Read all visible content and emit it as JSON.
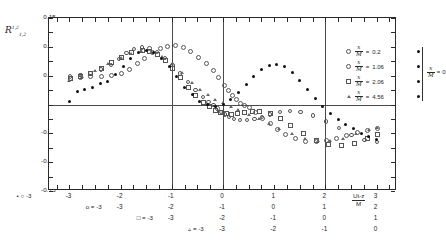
{
  "chart_data": {
    "type": "scatter",
    "title": "",
    "ylabel": "R_{1,2}^{1,2}",
    "xlabel": "Ut-z/M",
    "ylim": [
      -0.15,
      0.15
    ],
    "yticks": [
      0.15,
      0.1,
      0.05,
      0,
      -0.05,
      -0.1,
      -0.15
    ],
    "ytick_labels": [
      "0.15",
      "0.10",
      "0.05",
      "0",
      "-0.05",
      "-0.10",
      "-0.15"
    ],
    "xlim": [
      -3.4,
      3.4
    ],
    "xticks": [
      -3,
      -2,
      -1,
      0,
      1,
      2,
      3
    ],
    "grid": "major vertical rules at x = -1, 0, 2 and horizontal zero line",
    "legend_position": "upper-right inset",
    "series": [
      {
        "name": "x/M = 0.2",
        "marker": "open-circle",
        "xoffset": 0,
        "axis_row": 0,
        "x": [
          -3.0,
          -2.8,
          -2.6,
          -2.4,
          -2.2,
          -2.0,
          -1.85,
          -1.7,
          -1.55,
          -1.4,
          -1.25,
          -1.1,
          -0.95,
          -0.8,
          -0.65,
          -0.5,
          -0.35,
          -0.2,
          -0.1,
          0,
          0.08,
          0.16,
          0.24,
          0.32,
          0.4,
          0.5,
          0.62,
          0.75,
          0.9,
          1.05,
          1.2,
          1.4,
          1.6,
          1.8,
          2.0,
          2.2,
          2.4,
          2.6,
          2.8,
          3.0
        ],
        "y": [
          0.047,
          0.048,
          0.05,
          0.05,
          0.052,
          0.055,
          0.063,
          0.072,
          0.082,
          0.092,
          0.099,
          0.103,
          0.104,
          0.1,
          0.093,
          0.084,
          0.073,
          0.06,
          0.048,
          0.035,
          0.026,
          0.018,
          0.01,
          0.004,
          0.0,
          -0.004,
          -0.012,
          -0.022,
          -0.032,
          -0.042,
          -0.05,
          -0.058,
          -0.062,
          -0.063,
          -0.061,
          -0.057,
          -0.052,
          -0.047,
          -0.043,
          -0.04
        ]
      },
      {
        "name": "x/M = 1.06",
        "marker": "open-circle-small",
        "xoffset": 1,
        "axis_row": 1,
        "x": [
          -3.0,
          -2.8,
          -2.6,
          -2.4,
          -2.2,
          -2.05,
          -1.9,
          -1.75,
          -1.6,
          -1.45,
          -1.3,
          -1.15,
          -1.0,
          -0.85,
          -0.7,
          -0.55,
          -0.4,
          -0.3,
          -0.2,
          -0.12,
          -0.05,
          0.02,
          0.1,
          0.2,
          0.32,
          0.45,
          0.6,
          0.75,
          0.9,
          1.1,
          1.3,
          1.5,
          1.75,
          2.0,
          2.25,
          2.5,
          2.75,
          3.0
        ],
        "y": [
          0.05,
          0.052,
          0.056,
          0.062,
          0.07,
          0.08,
          0.09,
          0.097,
          0.1,
          0.098,
          0.092,
          0.082,
          0.07,
          0.055,
          0.04,
          0.026,
          0.014,
          0.006,
          0.0,
          -0.006,
          -0.012,
          -0.016,
          -0.02,
          -0.024,
          -0.026,
          -0.026,
          -0.024,
          -0.02,
          -0.016,
          -0.012,
          -0.01,
          -0.012,
          -0.018,
          -0.028,
          -0.04,
          -0.052,
          -0.06,
          -0.064
        ]
      },
      {
        "name": "x/M = 2.06",
        "marker": "open-square",
        "xoffset": 2,
        "axis_row": 2,
        "x": [
          -3.0,
          -2.8,
          -2.6,
          -2.4,
          -2.2,
          -2.0,
          -1.8,
          -1.6,
          -1.45,
          -1.3,
          -1.15,
          -1.0,
          -0.85,
          -0.7,
          -0.55,
          -0.4,
          -0.28,
          -0.16,
          -0.06,
          0.04,
          0.14,
          0.26,
          0.4,
          0.55,
          0.7,
          0.9,
          1.1,
          1.3,
          1.55,
          1.8,
          2.05,
          2.3,
          2.55,
          2.8,
          3.0
        ],
        "y": [
          0.046,
          0.05,
          0.056,
          0.064,
          0.074,
          0.084,
          0.092,
          0.096,
          0.094,
          0.088,
          0.078,
          0.064,
          0.048,
          0.032,
          0.018,
          0.006,
          -0.002,
          -0.008,
          -0.012,
          -0.014,
          -0.015,
          -0.014,
          -0.012,
          -0.01,
          -0.01,
          -0.014,
          -0.022,
          -0.034,
          -0.048,
          -0.06,
          -0.068,
          -0.07,
          -0.066,
          -0.058,
          -0.05
        ]
      },
      {
        "name": "x/M = 4.56",
        "marker": "triangle",
        "xoffset": 3,
        "axis_row": 3,
        "x": [
          -3.0,
          -2.75,
          -2.5,
          -2.25,
          -2.0,
          -1.8,
          -1.6,
          -1.4,
          -1.2,
          -1.0,
          -0.8,
          -0.6,
          -0.45,
          -0.3,
          -0.15,
          0,
          0.15,
          0.3,
          0.5,
          0.7,
          0.9,
          1.1,
          1.35,
          1.6,
          1.85,
          2.1,
          2.35,
          2.6,
          2.85,
          3.0
        ],
        "y": [
          0.04,
          0.048,
          0.058,
          0.07,
          0.08,
          0.088,
          0.092,
          0.09,
          0.082,
          0.07,
          0.054,
          0.038,
          0.026,
          0.016,
          0.008,
          0.002,
          -0.004,
          -0.01,
          -0.018,
          -0.026,
          -0.034,
          -0.042,
          -0.052,
          -0.06,
          -0.064,
          -0.064,
          -0.06,
          -0.052,
          -0.044,
          -0.04
        ]
      },
      {
        "name": "x/M = 0",
        "marker": "filled-circle",
        "xoffset": 0,
        "axis_row": "all",
        "x": [
          -3.0,
          -2.85,
          -2.7,
          -2.55,
          -2.4,
          -2.25,
          -2.1,
          -1.95,
          -1.8,
          -1.65,
          -1.5,
          -1.35,
          -1.2,
          -1.05,
          -0.9,
          -0.75,
          -0.6,
          -0.45,
          -0.3,
          -0.15,
          0,
          0.15,
          0.3,
          0.45,
          0.6,
          0.75,
          0.9,
          1.05,
          1.2,
          1.35,
          1.5,
          1.65,
          1.8,
          1.95,
          2.1,
          2.25,
          2.4,
          2.55,
          2.7,
          2.85,
          3.0
        ],
        "y": [
          0.006,
          0.022,
          0.026,
          0.03,
          0.036,
          0.04,
          0.052,
          0.066,
          0.08,
          0.09,
          0.094,
          0.09,
          0.08,
          0.066,
          0.048,
          0.03,
          0.018,
          0.006,
          0.0,
          -0.004,
          0.0,
          0.008,
          0.02,
          0.034,
          0.048,
          0.06,
          0.068,
          0.07,
          0.066,
          0.056,
          0.042,
          0.026,
          0.01,
          -0.004,
          -0.016,
          -0.026,
          -0.034,
          -0.042,
          -0.05,
          -0.056,
          -0.06
        ]
      }
    ]
  },
  "yaxis": {
    "title_main": "R",
    "title_sup": "1,2",
    "title_sub": "1,2",
    "ticks": [
      "0.15",
      "0.10",
      "0.05",
      "0",
      "-0.05",
      "-0.10",
      "-0.15"
    ]
  },
  "xaxis": {
    "title_num": "Ut-z",
    "title_den": "M",
    "rows": [
      {
        "key": "o",
        "eq": "=",
        "val": "-3",
        "labels": [
          "-3",
          "-2",
          "-1",
          "0",
          "1",
          "2",
          "3"
        ]
      },
      {
        "key": "o",
        "eq": "=",
        "val": "-3",
        "labels": [
          "-3",
          "-2",
          "-1",
          "0",
          "1",
          "2",
          "3"
        ]
      },
      {
        "key": "□",
        "eq": "=",
        "val": "-3",
        "labels": [
          "-3",
          "-2",
          "-1",
          "0",
          "1",
          "2",
          "3"
        ]
      },
      {
        "key": "▵",
        "eq": "=",
        "val": "-3",
        "labels": [
          "-3",
          "-2",
          "-1",
          "0",
          "1",
          "2",
          "3"
        ]
      }
    ]
  },
  "legend": {
    "entries": [
      {
        "marker": "open-circle",
        "num": "x",
        "den": "M",
        "eq": "=",
        "value": "0.2"
      },
      {
        "marker": "open-circle",
        "num": "x",
        "den": "M",
        "eq": "=",
        "value": "1.06"
      },
      {
        "marker": "open-square",
        "num": "x",
        "den": "M",
        "eq": "=",
        "value": "2.06"
      },
      {
        "marker": "triangle",
        "num": "x",
        "den": "M",
        "eq": "=",
        "value": "4.56"
      }
    ],
    "bracket": {
      "num": "x",
      "den": "M",
      "eq": "=",
      "value": "0",
      "marker": "filled-circle"
    }
  },
  "colors": {
    "ink": "#1a1a1a",
    "axis": "#2a2a2a",
    "open_marker": "#555555",
    "filled_marker": "#111111",
    "background": "#ffffff"
  }
}
